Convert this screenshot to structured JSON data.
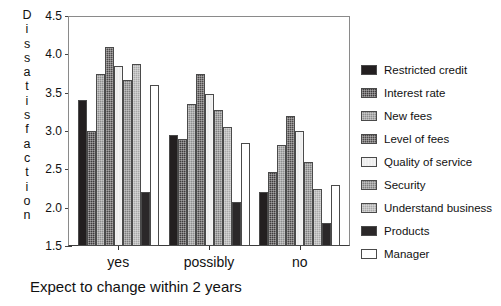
{
  "chart_data": {
    "type": "bar",
    "title": "",
    "xlabel": "Expect to change within 2 years",
    "ylabel": "Dissatisfaction",
    "categories": [
      "yes",
      "possibly",
      "no"
    ],
    "ylim": [
      1.5,
      4.5
    ],
    "yticks": [
      "1.5",
      "2.0",
      "2.5",
      "3.0",
      "3.5",
      "4.0",
      "4.5"
    ],
    "grid": false,
    "legend_position": "right",
    "series": [
      {
        "name": "Restricted credit",
        "color": "#231f20",
        "texture": "solid",
        "values": [
          3.4,
          2.95,
          2.2
        ]
      },
      {
        "name": "Interest rate",
        "color": "#3f3c3d",
        "texture": "dots",
        "values": [
          3.0,
          2.9,
          2.47
        ]
      },
      {
        "name": "New fees",
        "color": "#8d8d8d",
        "texture": "dots",
        "values": [
          3.75,
          3.35,
          2.82
        ]
      },
      {
        "name": "Level of fees",
        "color": "#4c4949",
        "texture": "dots",
        "values": [
          4.1,
          3.75,
          3.2
        ]
      },
      {
        "name": "Quality of service",
        "color": "#eeeeee",
        "texture": "vlines",
        "values": [
          3.85,
          3.48,
          3.0
        ]
      },
      {
        "name": "Security",
        "color": "#7e7e7e",
        "texture": "dots",
        "values": [
          3.67,
          3.27,
          2.6
        ]
      },
      {
        "name": "Understand business",
        "color": "#a9a9a9",
        "texture": "dots",
        "values": [
          3.88,
          3.05,
          2.24
        ]
      },
      {
        "name": "Products",
        "color": "#2b2829",
        "texture": "solid",
        "values": [
          2.2,
          2.07,
          1.8
        ]
      },
      {
        "name": "Manager",
        "color": "#ffffff",
        "texture": "solid",
        "values": [
          3.6,
          2.85,
          2.3
        ]
      }
    ]
  },
  "axis": {
    "y_title_letters": [
      "D",
      "i",
      "s",
      "s",
      "a",
      "t",
      "i",
      "s",
      "f",
      "a",
      "c",
      "t",
      "i",
      "o",
      "n"
    ]
  }
}
